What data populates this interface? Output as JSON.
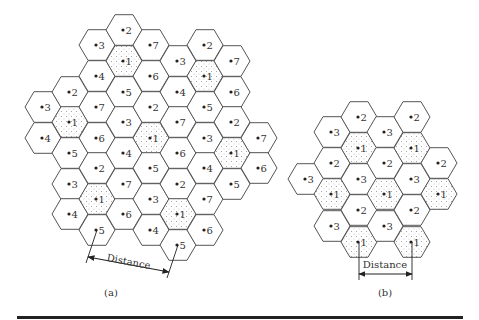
{
  "figure": {
    "hex_radius": 18,
    "colors": {
      "stroke": "#555555",
      "reuse_dot": "#888888",
      "rule": "#222222"
    },
    "panels": [
      {
        "id": "a",
        "caption": "(a)",
        "caption_pos": [
          111,
          296
        ],
        "reuse_label": "1",
        "cells": [
          {
            "x": 43,
            "y": 107,
            "n": "3"
          },
          {
            "x": 43,
            "y": 138,
            "n": "4"
          },
          {
            "x": 70,
            "y": 92,
            "n": "2"
          },
          {
            "x": 70,
            "y": 122,
            "n": "1"
          },
          {
            "x": 70,
            "y": 153,
            "n": "5"
          },
          {
            "x": 70,
            "y": 184,
            "n": "3"
          },
          {
            "x": 70,
            "y": 214,
            "n": "4"
          },
          {
            "x": 97,
            "y": 45,
            "n": "3"
          },
          {
            "x": 97,
            "y": 76,
            "n": "4"
          },
          {
            "x": 97,
            "y": 107,
            "n": "7"
          },
          {
            "x": 97,
            "y": 138,
            "n": "6"
          },
          {
            "x": 97,
            "y": 168,
            "n": "2"
          },
          {
            "x": 97,
            "y": 199,
            "n": "1"
          },
          {
            "x": 97,
            "y": 230,
            "n": "5"
          },
          {
            "x": 124,
            "y": 30,
            "n": "2"
          },
          {
            "x": 124,
            "y": 61,
            "n": "1"
          },
          {
            "x": 124,
            "y": 92,
            "n": "5"
          },
          {
            "x": 124,
            "y": 122,
            "n": "3"
          },
          {
            "x": 124,
            "y": 153,
            "n": "4"
          },
          {
            "x": 124,
            "y": 184,
            "n": "7"
          },
          {
            "x": 124,
            "y": 214,
            "n": "6"
          },
          {
            "x": 151,
            "y": 45,
            "n": "7"
          },
          {
            "x": 151,
            "y": 76,
            "n": "6"
          },
          {
            "x": 151,
            "y": 107,
            "n": "2"
          },
          {
            "x": 151,
            "y": 138,
            "n": "1"
          },
          {
            "x": 151,
            "y": 168,
            "n": "5"
          },
          {
            "x": 151,
            "y": 199,
            "n": "3"
          },
          {
            "x": 151,
            "y": 230,
            "n": "4"
          },
          {
            "x": 178,
            "y": 61,
            "n": "3"
          },
          {
            "x": 178,
            "y": 92,
            "n": "4"
          },
          {
            "x": 178,
            "y": 122,
            "n": "7"
          },
          {
            "x": 178,
            "y": 153,
            "n": "6"
          },
          {
            "x": 178,
            "y": 184,
            "n": "2"
          },
          {
            "x": 178,
            "y": 214,
            "n": "1"
          },
          {
            "x": 178,
            "y": 245,
            "n": "5"
          },
          {
            "x": 205,
            "y": 45,
            "n": "2"
          },
          {
            "x": 205,
            "y": 76,
            "n": "1"
          },
          {
            "x": 205,
            "y": 107,
            "n": "5"
          },
          {
            "x": 205,
            "y": 138,
            "n": "3"
          },
          {
            "x": 205,
            "y": 168,
            "n": "4"
          },
          {
            "x": 205,
            "y": 199,
            "n": "7"
          },
          {
            "x": 205,
            "y": 230,
            "n": "6"
          },
          {
            "x": 232,
            "y": 61,
            "n": "7"
          },
          {
            "x": 232,
            "y": 92,
            "n": "6"
          },
          {
            "x": 232,
            "y": 122,
            "n": "2"
          },
          {
            "x": 232,
            "y": 153,
            "n": "1"
          },
          {
            "x": 232,
            "y": 184,
            "n": "5"
          },
          {
            "x": 259,
            "y": 138,
            "n": "7"
          },
          {
            "x": 259,
            "y": 168,
            "n": "6"
          }
        ],
        "distance": {
          "label": "Distance",
          "from": [
            97,
            230
          ],
          "to": [
            178,
            245
          ],
          "arrow_start": [
            88,
            257
          ],
          "arrow_end": [
            169,
            272
          ],
          "label_pos": [
            128,
            265
          ],
          "label_angle": 11
        }
      },
      {
        "id": "b",
        "caption": "(b)",
        "caption_pos": [
          385,
          296
        ],
        "reuse_label": "1",
        "cells": [
          {
            "x": 306,
            "y": 179,
            "n": "3"
          },
          {
            "x": 332,
            "y": 132,
            "n": "3"
          },
          {
            "x": 332,
            "y": 163,
            "n": "2"
          },
          {
            "x": 332,
            "y": 194,
            "n": "1"
          },
          {
            "x": 332,
            "y": 226,
            "n": "3"
          },
          {
            "x": 359,
            "y": 117,
            "n": "2"
          },
          {
            "x": 359,
            "y": 148,
            "n": "1"
          },
          {
            "x": 359,
            "y": 179,
            "n": "3"
          },
          {
            "x": 359,
            "y": 210,
            "n": "2"
          },
          {
            "x": 359,
            "y": 242,
            "n": "1"
          },
          {
            "x": 385,
            "y": 132,
            "n": "3"
          },
          {
            "x": 385,
            "y": 163,
            "n": "2"
          },
          {
            "x": 385,
            "y": 194,
            "n": "1"
          },
          {
            "x": 385,
            "y": 226,
            "n": "3"
          },
          {
            "x": 412,
            "y": 117,
            "n": "2"
          },
          {
            "x": 412,
            "y": 148,
            "n": "1"
          },
          {
            "x": 412,
            "y": 179,
            "n": "3"
          },
          {
            "x": 412,
            "y": 210,
            "n": "2"
          },
          {
            "x": 412,
            "y": 242,
            "n": "1"
          },
          {
            "x": 439,
            "y": 163,
            "n": "2"
          },
          {
            "x": 439,
            "y": 194,
            "n": "1"
          }
        ],
        "distance": {
          "label": "Distance",
          "from": [
            359,
            242
          ],
          "to": [
            412,
            242
          ],
          "arrow_start": [
            359,
            274
          ],
          "arrow_end": [
            412,
            274
          ],
          "label_pos": [
            385,
            268
          ],
          "label_angle": 0
        }
      }
    ]
  }
}
